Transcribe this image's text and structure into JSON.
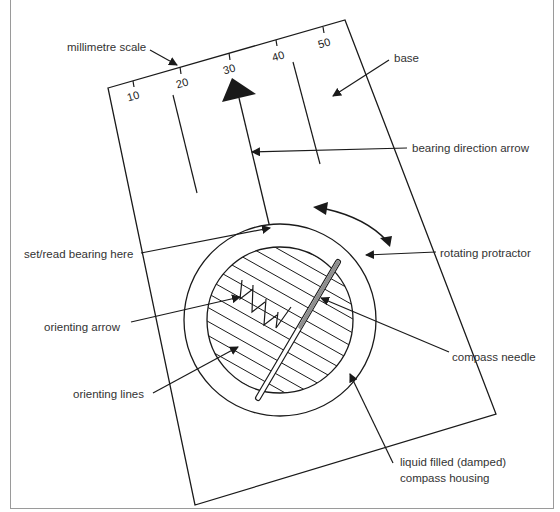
{
  "diagram": {
    "colors": {
      "line": "#1a1a1a",
      "needle_red": "#8f8f8f",
      "text": "#333333",
      "frame": "#9a9a9a"
    },
    "scale_numbers": [
      "10",
      "20",
      "30",
      "40",
      "50"
    ],
    "labels": {
      "millimetre_scale": "millimetre scale",
      "base": "base",
      "bearing_direction_arrow": "bearing direction arrow",
      "set_read_bearing": "set/read bearing here",
      "rotating_protractor": "rotating protractor",
      "orienting_arrow": "orienting arrow",
      "compass_needle": "compass needle",
      "orienting_lines": "orienting lines",
      "housing_line1": "liquid filled (damped)",
      "housing_line2": "compass housing"
    }
  }
}
